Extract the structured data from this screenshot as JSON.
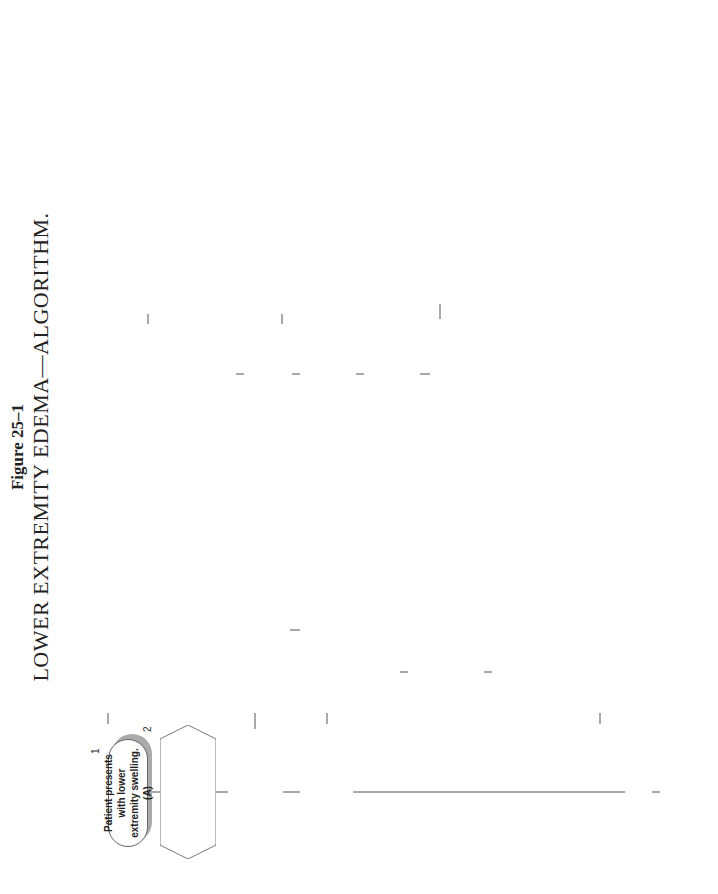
{
  "figure": {
    "label": "Figure 25–1",
    "title": "LOWER EXTREMITY EDEMA—ALGORITHM."
  },
  "connector_labels": {
    "yes": "Yes",
    "no": "No"
  },
  "nodes": {
    "n1": {
      "num": "1",
      "text": "Patient presents with lower extremity swelling. (A)"
    },
    "n2": {
      "num": "2",
      "text": "Unilateral, sudden onset, of calf pain and swelling. History of",
      "items": [
        "trauma",
        "immobilization",
        "BCP? (B)"
      ]
    },
    "n3": {
      "num": "3",
      "text": "DVT is likely. Homan's test may or may not be positive.  Refer for Doppler ultrasound. Treatment involves a trial of anticoagulant therapy. Surgery is reserved for recalcitrant cases."
    },
    "n4": {
      "num": "4",
      "text": "Unilateral lower leg edema in a female > age 40, without history of trauma, immobilization, or BCPs?"
    },
    "n5": {
      "num": "5",
      "text": "Investigate the possibility of a pelvic tumor. Swelling will be due to lymph blockage. Medical referral if suspected."
    },
    "n6": {
      "num": "6",
      "text": "Chronic, bilateral, pitting edema?"
    },
    "n7": {
      "num": "7",
      "text": "Patient has one or more of the following:",
      "items": [
        "difficulty breathing with minor exertion",
        "orthopnea",
        "ascites",
        "distended neck veins?"
      ]
    },
    "n8": {
      "num": "8",
      "text": "Perform a general lab including UA. Check",
      "items": [
        "albumin in blood and urine",
        "liver enzymes",
        "BUN/creatinine"
      ]
    },
    "n9": {
      "num": "9",
      "text": "Evaluate patient for evidence of cardiac or pulmonary pathology. Auscultate heart and lungs. Order chest radiograph."
    },
    "n10": {
      "num": "10",
      "text": "Serum albumin is low with an increase in liver enzymes. Urine albumin is negative? (C)"
    },
    "n11": {
      "num": "11",
      "text": "Liver pathology is likely cause (decrease in albumin production decreases osmotic pressure in blood vessels). Refer for medical evaluation."
    },
    "n12": {
      "num": "12",
      "text": "If congestive heart failure confirmed, refer to MD for probable diuretic therapy and evaluation of other contributing factors."
    },
    "n13": {
      "num": "13",
      "text": "Serum albumin is low, liver enzymes normal, albumin in urine?"
    },
    "n14": {
      "num": "14",
      "text": "Kidney pathology likely. Diabetes or chronic renal failure is possible cause. Refer for medical evaluation."
    },
    "n15": {
      "num": "15",
      "text": "Patient is either:",
      "items": [
        "elderly and sedentary",
        "stands for prolonged periods of time"
      ]
    },
    "n16": {
      "num": "16",
      "text": "Edema due to a combination of",
      "items": [
        "lack of muscular pumping",
        "hydrostatic pressure with pooling (in the elderly), decreased skin turgor."
      ],
      "text2": "Elastic stockings, movement, and elevation of legs should be recommended. Recommend a decrease in salt intake."
    },
    "n17": {
      "num": "17",
      "text": "In an obese patient, swelling that does not involve the feet is likely lipedema (deposition of fat)."
    },
    "n18": {
      "num": "18",
      "text": "\"Edema\" is isolated over the tibial crests?"
    },
    "n19": {
      "num": "19",
      "text": "Evaluate for hyperthyroidism. Check FT4 and S-TSH if suspected.  Refer if positive. (see thyroid algorithm)"
    },
    "n20": {
      "num": "20",
      "text": "In athletes, check for compartment syndrome. If trauma is the cause, evaluate for specific local damage. (D)"
    }
  },
  "annotations": {
    "heading": "Annotations",
    "items": [
      {
        "key": "A.",
        "text": "The history should include a list of current medications. Fluid retention occurs with vasodilators, estrogen, BCP, NSAIDs, lithium, and tricyclic antidepressants. The examination should include a search for exact location and whether the edema is pitting or nonpitting."
      },
      {
        "key": "B.",
        "text": "DVT is relatively common in the older patient. A common cause is minor trauma to the calf. Differentiation from a simple contusion is persistence of the swelling. Refer if unable to differentiate."
      },
      {
        "key": "C.",
        "text": "Significant elevations of liver enzymes are necessary to correlate and warrant the need for referral. Levels should be several times normal."
      },
      {
        "key": "D.",
        "text": "A compartment syndrome occurs as a result of increased pressure within a muscular compartment that is restricted by the fascia.  This may be secondary to a fracture or due to exercise such as running."
      }
    ]
  },
  "colors": {
    "shadow": "#bbbbbb",
    "border": "#777777",
    "line": "#555555"
  }
}
